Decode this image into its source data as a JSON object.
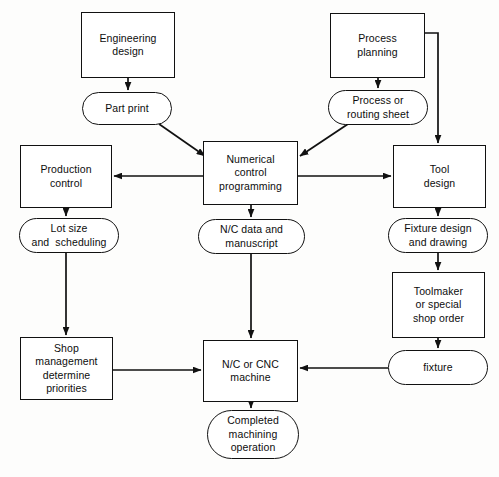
{
  "diagram": {
    "type": "flowchart",
    "canvas": {
      "width": 499,
      "height": 477
    },
    "style": {
      "background": "#fdfdfc",
      "stroke": "#111111",
      "fill": "#ffffff",
      "text": "#0d0d0d"
    },
    "nodes": [
      {
        "id": "engineering-design",
        "label": "Engineering\ndesign",
        "shape": "process",
        "x": 81,
        "y": 12,
        "w": 94,
        "h": 66
      },
      {
        "id": "process-planning",
        "label": "Process\nplanning",
        "shape": "process",
        "x": 330,
        "y": 13,
        "w": 95,
        "h": 65
      },
      {
        "id": "part-print",
        "label": "Part print",
        "shape": "pill",
        "x": 82,
        "y": 92,
        "w": 90,
        "h": 33
      },
      {
        "id": "process-or-routing-sheet",
        "label": "Process or\nrouting sheet",
        "shape": "pill",
        "x": 328,
        "y": 90,
        "w": 100,
        "h": 35
      },
      {
        "id": "production-control",
        "label": "Production\ncontrol",
        "shape": "process",
        "x": 20,
        "y": 145,
        "w": 92,
        "h": 63
      },
      {
        "id": "numerical-control-programming",
        "label": "Numerical\ncontrol\nprogramming",
        "shape": "process",
        "x": 203,
        "y": 141,
        "w": 95,
        "h": 64
      },
      {
        "id": "tool-design",
        "label": "Tool\ndesign",
        "shape": "process",
        "x": 393,
        "y": 145,
        "w": 93,
        "h": 63
      },
      {
        "id": "lot-size-and-scheduling",
        "label": "Lot size\nand  scheduling",
        "shape": "pill",
        "x": 19,
        "y": 218,
        "w": 100,
        "h": 35
      },
      {
        "id": "nc-data-and-manuscript",
        "label": "N/C data and\nmanuscript",
        "shape": "pill",
        "x": 198,
        "y": 219,
        "w": 107,
        "h": 35
      },
      {
        "id": "fixture-design-and-drawing",
        "label": "Fixture design\nand drawing",
        "shape": "pill",
        "x": 388,
        "y": 218,
        "w": 100,
        "h": 35
      },
      {
        "id": "toolmaker-or-special-shop-order",
        "label": "Toolmaker\nor special\nshop order",
        "shape": "process",
        "x": 392,
        "y": 272,
        "w": 93,
        "h": 66
      },
      {
        "id": "shop-management-determine-priorities",
        "label": "Shop\nmanagement\ndetermine\npriorities",
        "shape": "process",
        "x": 20,
        "y": 337,
        "w": 93,
        "h": 63
      },
      {
        "id": "nc-or-cnc-machine",
        "label": "N/C or CNC\nmachine",
        "shape": "process",
        "x": 203,
        "y": 340,
        "w": 95,
        "h": 62
      },
      {
        "id": "fixture",
        "label": "fixture",
        "shape": "pill",
        "x": 388,
        "y": 350,
        "w": 100,
        "h": 35
      },
      {
        "id": "completed-machining-operation",
        "label": "Completed\nmachining\noperation",
        "shape": "pill",
        "x": 207,
        "y": 410,
        "w": 92,
        "h": 49
      }
    ],
    "edges": [
      {
        "id": "engineering-design-to-part-print",
        "from": "engineering-design",
        "to": "part-print",
        "points": "128,78 128,90",
        "arrow": true
      },
      {
        "id": "part-print-to-numerical-control-programming",
        "from": "part-print",
        "to": "numerical-control-programming",
        "points": "159,124 205,156",
        "arrow": true
      },
      {
        "id": "process-planning-to-process-or-routing-sheet",
        "from": "process-planning",
        "to": "process-or-routing-sheet",
        "points": "378,78 378,88",
        "arrow": true
      },
      {
        "id": "process-planning-to-tool-design",
        "from": "process-planning",
        "to": "tool-design",
        "points": "425,33 438,33 438,143",
        "arrow": true
      },
      {
        "id": "process-or-routing-sheet-to-numerical-control-programming",
        "from": "process-or-routing-sheet",
        "to": "numerical-control-programming",
        "points": "348,124 300,156",
        "arrow": true
      },
      {
        "id": "numerical-control-programming-to-production-control",
        "from": "numerical-control-programming",
        "to": "production-control",
        "points": "203,176 114,176",
        "arrow": true
      },
      {
        "id": "numerical-control-programming-to-tool-design",
        "from": "numerical-control-programming",
        "to": "tool-design",
        "points": "298,176 391,176",
        "arrow": true
      },
      {
        "id": "numerical-control-programming-to-nc-data-and-manuscript",
        "from": "numerical-control-programming",
        "to": "nc-data-and-manuscript",
        "points": "251,205 251,217",
        "arrow": true
      },
      {
        "id": "production-control-to-lot-size-and-scheduling",
        "from": "production-control",
        "to": "lot-size-and-scheduling",
        "points": "66,208 66,216",
        "arrow": true
      },
      {
        "id": "tool-design-to-fixture-design-and-drawing",
        "from": "tool-design",
        "to": "fixture-design-and-drawing",
        "points": "438,208 438,216",
        "arrow": true
      },
      {
        "id": "lot-size-and-scheduling-to-shop-management",
        "from": "lot-size-and-scheduling",
        "to": "shop-management-determine-priorities",
        "points": "66,253 66,335",
        "arrow": true
      },
      {
        "id": "nc-data-and-manuscript-to-nc-or-cnc-machine",
        "from": "nc-data-and-manuscript",
        "to": "nc-or-cnc-machine",
        "points": "251,254 251,338",
        "arrow": true
      },
      {
        "id": "fixture-design-and-drawing-to-toolmaker",
        "from": "fixture-design-and-drawing",
        "to": "toolmaker-or-special-shop-order",
        "points": "438,253 438,270",
        "arrow": true
      },
      {
        "id": "toolmaker-to-fixture",
        "from": "toolmaker-or-special-shop-order",
        "to": "fixture",
        "points": "438,338 438,348",
        "arrow": true
      },
      {
        "id": "shop-management-to-nc-or-cnc-machine",
        "from": "shop-management-determine-priorities",
        "to": "nc-or-cnc-machine",
        "points": "113,370 201,370",
        "arrow": true
      },
      {
        "id": "fixture-to-nc-or-cnc-machine",
        "from": "fixture",
        "to": "nc-or-cnc-machine",
        "points": "388,368 300,368",
        "arrow": true
      },
      {
        "id": "nc-or-cnc-machine-to-completed-machining-operation",
        "from": "nc-or-cnc-machine",
        "to": "completed-machining-operation",
        "points": "251,402 251,408",
        "arrow": true
      }
    ]
  }
}
